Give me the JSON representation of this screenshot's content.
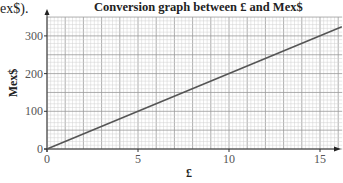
{
  "lead_text": "ex$).",
  "chart_data": {
    "type": "line",
    "title": "Conversion graph between £ and Mex$",
    "xlabel": "£",
    "ylabel": "Mex$",
    "xlim": [
      0,
      16
    ],
    "ylim": [
      0,
      350
    ],
    "x_ticks": [
      0,
      5,
      10,
      15
    ],
    "y_ticks": [
      0,
      100,
      200,
      300
    ],
    "x_tick_labels": [
      "0",
      "5",
      "10",
      "15"
    ],
    "y_tick_labels": [
      "0",
      "100",
      "200",
      "300"
    ],
    "grid": true,
    "grid_minor_x": 0.2,
    "grid_major_x": 1,
    "grid_minor_y": 10,
    "grid_major_y": 50,
    "series": [
      {
        "name": "Conversion",
        "x": [
          0,
          16.2
        ],
        "y": [
          0,
          324
        ]
      }
    ],
    "rate": "1 £ = 20 Mex$",
    "line_color": "#555555",
    "grid_color": "#bbbbbb"
  }
}
